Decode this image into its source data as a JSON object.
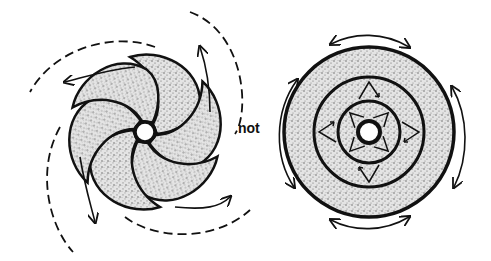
{
  "figure": {
    "left_panel": {
      "description": "spiral-arm-pattern",
      "arms": 6,
      "motion": "rotational-outward-spiral"
    },
    "connector_label": "not",
    "right_panel": {
      "description": "concentric-rings",
      "rings": 3,
      "motion": "circular-and-radial"
    },
    "colors": {
      "ink": "#111111",
      "stipple": "#c8c8c8",
      "background": "#ffffff"
    }
  }
}
